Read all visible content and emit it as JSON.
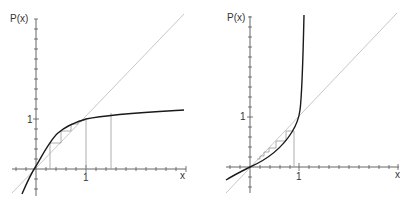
{
  "panels": [
    {
      "id": "left",
      "y_label": "P(x)",
      "x_label": "x",
      "x_tick_label": "1",
      "y_tick_label": "1",
      "description": "Concave saturating curve P(x) crossing diagonal y=x at origin and near x=1; cobweb iteration converges to fixed point near 1",
      "colors": {
        "curve": "#1a1a1a",
        "diagonal": "#c8c8c8",
        "axes": "#555555",
        "cobweb": "#9a9a9a"
      }
    },
    {
      "id": "right",
      "y_label": "P(x)",
      "x_label": "x",
      "x_tick_label": "1",
      "y_tick_label": "1",
      "description": "Convex curve P(x) with vertical asymptote just beyond x=1; cobweb iteration from below x=1 converges to 0",
      "colors": {
        "curve": "#1a1a1a",
        "diagonal": "#c8c8c8",
        "axes": "#555555",
        "cobweb": "#9a9a9a"
      }
    }
  ]
}
